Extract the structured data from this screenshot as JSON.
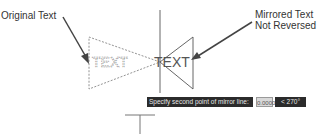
{
  "callouts": {
    "original": "Original Text",
    "mirrored_line1": "Mirrored Text",
    "mirrored_line2": "Not Reversed"
  },
  "drawing": {
    "original_text": "TEXT",
    "mirrored_text": "TEXT",
    "colors": {
      "line": "#555555",
      "dashed": "#777777",
      "arrow": "#444444"
    }
  },
  "dynamic_input": {
    "prompt": "Specify second point of mirror line:",
    "value": "0.0000",
    "angle": "< 270°"
  }
}
